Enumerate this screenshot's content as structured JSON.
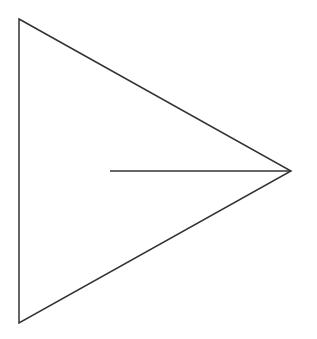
{
  "diagram": {
    "background": "#ffffff",
    "stroke_color": "#333333",
    "stroke_width": 1.5,
    "triangle": {
      "points": [
        [
          19,
          19
        ],
        [
          291,
          171
        ],
        [
          19,
          323
        ]
      ]
    },
    "line": {
      "x1": 110,
      "y1": 171,
      "x2": 291,
      "y2": 171
    }
  }
}
